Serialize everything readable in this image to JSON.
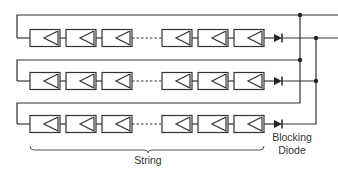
{
  "diagram": {
    "rows": 3,
    "panels_per_string_visible": 6,
    "line_color": "#333333",
    "labels": {
      "string": "String",
      "blocking_diode_line1": "Blocking",
      "blocking_diode_line2": "Diode"
    },
    "components": {
      "panel-icon": "solar-module",
      "diode-icon": "blocking-diode",
      "junction-icon": "node-dot"
    }
  }
}
